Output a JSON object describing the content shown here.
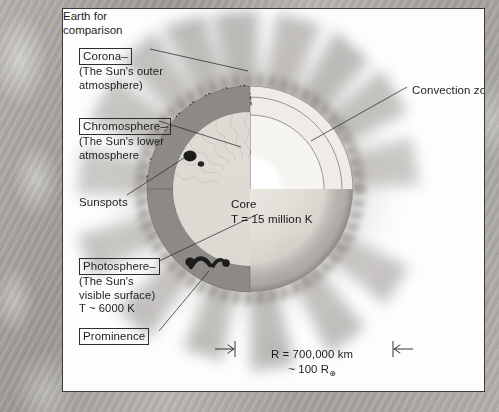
{
  "figure": {
    "labels": {
      "corona": {
        "title": "Corona–",
        "line1": "(The Sun's outer",
        "line2": "atmosphere)"
      },
      "chromosphere": {
        "title": "Chromosphere–",
        "line1": "(The Sun's lower",
        "line2": "atmosphere"
      },
      "sunspots": {
        "title": "Sunspots"
      },
      "photosphere": {
        "title": "Photosphere–",
        "line1": "(The Sun's",
        "line2": "visible surface)",
        "line3": "T ~ 6000 K"
      },
      "prominence": {
        "title": "Prominence"
      },
      "convection_zone": {
        "title": "Convection zone"
      },
      "core": {
        "title": "Core",
        "temperature": "T = 15 million K"
      },
      "earth_comparison": {
        "line1": "Earth for",
        "line2": "comparison"
      }
    },
    "scale_bar": {
      "radius": "R = 700,000 km",
      "earth_radii_prefix": "~ 100 R",
      "earth_symbol": "⊕"
    },
    "colors": {
      "page_background": "#a9a6a2",
      "panel_background": "#fdfdfd",
      "frame_border": "#3a3a3a",
      "ink": "#1d1d1d",
      "sun_disk": "#dedad4",
      "cut_face": "#8e8e8e",
      "radiative_zone": "#f1efeb",
      "core_fill": "#ffffff",
      "corona_glow": "#b6b3af"
    }
  }
}
